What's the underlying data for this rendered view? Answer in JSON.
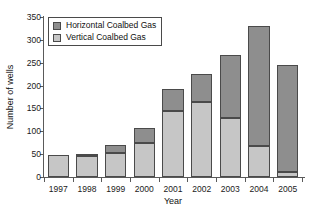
{
  "chart_data": {
    "type": "bar",
    "stacked": true,
    "title": "",
    "xlabel": "Year",
    "ylabel": "Number of wells",
    "categories": [
      "1997",
      "1998",
      "1999",
      "2000",
      "2001",
      "2002",
      "2003",
      "2004",
      "2005"
    ],
    "series": [
      {
        "name": "Vertical Coalbed Gas",
        "color": "#c6c6c6",
        "values": [
          49,
          46,
          53,
          75,
          145,
          164,
          129,
          68,
          10
        ]
      },
      {
        "name": "Horizontal Coalbed Gas",
        "color": "#8e8e8e",
        "values": [
          0,
          4,
          17,
          32,
          48,
          62,
          138,
          262,
          236
        ]
      }
    ],
    "totals": [
      49,
      50,
      70,
      107,
      193,
      226,
      267,
      330,
      246
    ],
    "ylim": [
      0,
      350
    ],
    "yticks": [
      0,
      50,
      100,
      150,
      200,
      250,
      300,
      350
    ],
    "ytick_labels": [
      "0",
      "50",
      "100",
      "150",
      "200",
      "250",
      "300",
      "350"
    ],
    "grid": false,
    "legend_position": "upper-left",
    "legend_entries": [
      "Horizontal Coalbed Gas",
      "Vertical Coalbed Gas"
    ]
  },
  "legend": {
    "items": [
      {
        "label": "Horizontal Coalbed Gas",
        "swatch": "horizontal"
      },
      {
        "label": "Vertical Coalbed Gas",
        "swatch": "vertical"
      }
    ]
  },
  "axes": {
    "y_title": "Number of wells",
    "x_title": "Year"
  },
  "colors": {
    "horizontal_fill": "#8e8e8e",
    "vertical_fill": "#c6c6c6",
    "bar_stroke": "#4a4a4a",
    "axis": "#5a5a5a",
    "background": "#ffffff"
  }
}
